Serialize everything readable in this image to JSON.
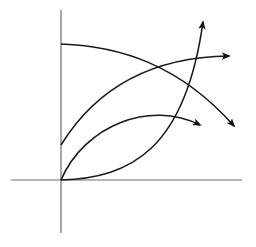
{
  "diagram": {
    "type": "curve-sketch",
    "colors": {
      "axis": "#6e6e6e",
      "curve": "#1a1a1a",
      "background": "#ffffff"
    },
    "axes": {
      "origin": [
        61,
        180
      ],
      "x_axis": {
        "from": [
          11,
          180
        ],
        "to": [
          242,
          180
        ]
      },
      "y_axis": {
        "from": [
          61,
          10
        ],
        "to": [
          61,
          233
        ]
      }
    },
    "curves": [
      {
        "name": "decreasing-curve",
        "start": [
          61,
          44
        ],
        "end": [
          236,
          128
        ],
        "arrow": "down-right",
        "path": "M61,44 C120,46 180,65 234,126"
      },
      {
        "name": "increasing-concave-curve",
        "start": [
          61,
          145
        ],
        "end": [
          234,
          56
        ],
        "arrow": "right",
        "path": "M61,145 C95,90 150,57 229,56"
      },
      {
        "name": "rise-and-fall-curve",
        "start": [
          61,
          180
        ],
        "end": [
          205,
          127
        ],
        "arrow": "right-down",
        "path": "M61,180 C85,125 150,100 200,125"
      },
      {
        "name": "exponential-growth-curve",
        "start": [
          61,
          180
        ],
        "end": [
          204,
          17
        ],
        "arrow": "up",
        "path": "M61,180 C130,178 185,150 203,22"
      }
    ]
  }
}
